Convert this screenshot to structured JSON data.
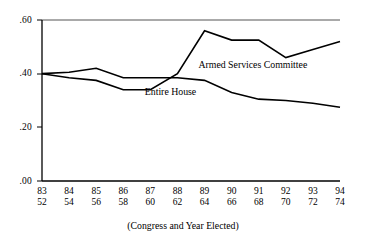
{
  "chart_data": {
    "type": "line",
    "title": "",
    "subtitle": "",
    "xlabel": "(Congress and Year Elected)",
    "ylabel": "",
    "ylim": [
      0.0,
      0.6
    ],
    "yticks": [
      0.0,
      0.2,
      0.4,
      0.6
    ],
    "ytick_labels": [
      ".00",
      ".20",
      ".40",
      ".60"
    ],
    "grid": false,
    "legend_position": "inline-annotations",
    "x_axis": {
      "congress": [
        "83",
        "84",
        "85",
        "86",
        "87",
        "88",
        "89",
        "90",
        "91",
        "92",
        "93",
        "94"
      ],
      "year_elected": [
        "52",
        "54",
        "56",
        "58",
        "60",
        "62",
        "64",
        "66",
        "68",
        "70",
        "72",
        "74"
      ]
    },
    "categories": [
      "83/52",
      "84/54",
      "85/56",
      "86/58",
      "87/60",
      "88/62",
      "89/64",
      "90/66",
      "91/68",
      "92/70",
      "93/72",
      "94/74"
    ],
    "series": [
      {
        "name": "Armed Services Committee",
        "values": [
          0.4,
          0.385,
          0.375,
          0.34,
          0.34,
          0.4,
          0.56,
          0.525,
          0.525,
          0.46,
          0.49,
          0.52
        ]
      },
      {
        "name": "Entire House",
        "values": [
          0.4,
          0.405,
          0.42,
          0.385,
          0.385,
          0.385,
          0.375,
          0.33,
          0.305,
          0.3,
          0.29,
          0.275
        ]
      }
    ],
    "annotations": [
      {
        "text": "Armed Services Committee",
        "x_frac": 0.525,
        "y_value": 0.435
      },
      {
        "text": "Entire House",
        "x_frac": 0.345,
        "y_value": 0.335
      }
    ],
    "colors": {
      "line": "#000000",
      "axis": "#000000",
      "background": "#ffffff",
      "text": "#000000"
    }
  }
}
